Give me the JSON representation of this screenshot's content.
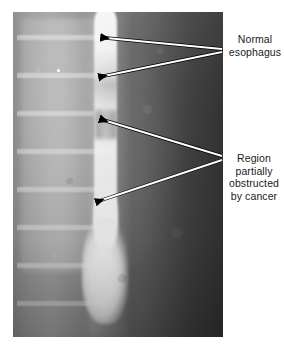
{
  "figure": {
    "type": "barium-swallow-radiograph",
    "modality_label": "x-ray",
    "background_color": "#ffffff",
    "image_region": {
      "x": 13,
      "y": 12,
      "width": 210,
      "height": 325
    }
  },
  "annotations": {
    "labels": [
      {
        "id": "normal-esophagus",
        "text": "Normal\nesophagus",
        "lines": [
          "Normal",
          "esophagus"
        ],
        "color": "#1a1a1a",
        "arrow_count": 2,
        "converge_point": {
          "x": 222,
          "y": 50
        },
        "arrow_tips": [
          {
            "x": 100,
            "y": 37
          },
          {
            "x": 98,
            "y": 77
          }
        ]
      },
      {
        "id": "obstructed-region",
        "text": "Region\npartially\nobstructed\nby cancer",
        "lines": [
          "Region",
          "partially",
          "obstructed",
          "by cancer"
        ],
        "color": "#1a1a1a",
        "arrow_count": 2,
        "converge_point": {
          "x": 222,
          "y": 158
        },
        "arrow_tips": [
          {
            "x": 99,
            "y": 119
          },
          {
            "x": 95,
            "y": 202
          }
        ]
      }
    ],
    "arrow_style": {
      "shaft_color": "#ffffff",
      "shaft_outline_color": "#000000",
      "head_color": "#000000"
    }
  }
}
